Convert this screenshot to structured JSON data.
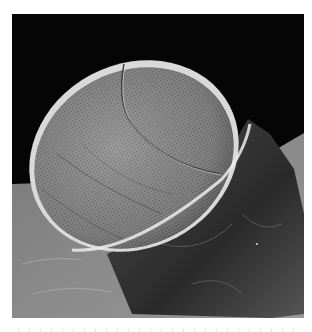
{
  "figure": {
    "type": "scanning electron micrograph",
    "colors": {
      "background": "#050505",
      "substrate": "#8a8a8a",
      "dome_surface": "#9c9c9c",
      "dome_rim": "#e6e6e6",
      "stalk": "#3a3a3a",
      "page": "#ffffff"
    }
  },
  "caption": {
    "visible": "clipped",
    "text": ""
  }
}
